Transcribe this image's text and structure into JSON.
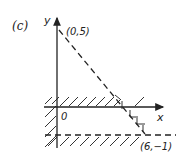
{
  "figure": {
    "panel_label": "(c)",
    "axes": {
      "x_label": "x",
      "y_label": "y",
      "origin_label": "0"
    },
    "points": [
      {
        "label": "(0,5)",
        "x": 0,
        "y": 5
      },
      {
        "label": "(6,−1)",
        "x": 6,
        "y": -1
      }
    ],
    "lines": [
      {
        "name": "diagonal-boundary",
        "style": "dashed",
        "from": [
          0,
          5
        ],
        "to": [
          6,
          -1
        ],
        "equation": "x + y = 5"
      },
      {
        "name": "horizontal-boundary",
        "style": "dashed",
        "equation": "y = -1"
      }
    ],
    "shaded_sides": [
      "above x-axis (y ≥ 0)",
      "left of y-axis (x ≤ 0)",
      "below y = -1",
      "right of x + y = 5"
    ],
    "colors": {
      "ink": "#222222",
      "background": "#ffffff"
    }
  }
}
